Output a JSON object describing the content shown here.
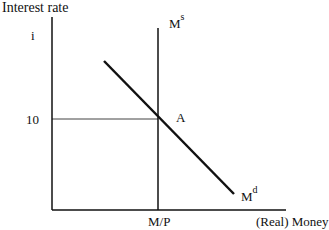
{
  "diagram": {
    "y_axis_label": "Interest rate",
    "y_axis_symbol": "i",
    "x_axis_label": "(Real) Money",
    "y_tick_label": "10",
    "x_tick_label": "M/P",
    "equilibrium_point_label": "A",
    "supply_curve": {
      "base": "M",
      "sup": "s"
    },
    "demand_curve": {
      "base": "M",
      "sup": "d"
    }
  }
}
